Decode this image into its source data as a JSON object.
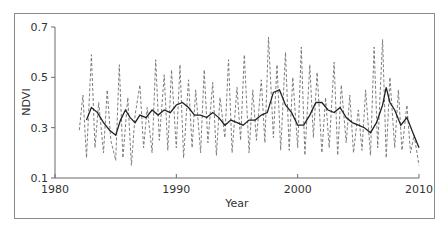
{
  "chart_data": {
    "type": "line",
    "title": "",
    "xlabel": "Year",
    "ylabel": "NDVI",
    "xlim": [
      1980,
      2010
    ],
    "ylim": [
      0.1,
      0.7
    ],
    "x_ticks": [
      1980,
      1990,
      2000,
      2010
    ],
    "y_ticks": [
      0.1,
      0.3,
      0.5,
      0.7
    ],
    "x_tick_labels": [
      "1980",
      "1990",
      "2000",
      "2010"
    ],
    "y_tick_labels": [
      "0.1",
      "0.3",
      "0.5",
      "0.7"
    ],
    "grid": false,
    "legend": null,
    "series": [
      {
        "name": "NDVI (raw)",
        "style": "dashed",
        "x": [
          1982.0,
          1982.3,
          1982.6,
          1983.0,
          1983.3,
          1983.6,
          1984.0,
          1984.3,
          1984.6,
          1985.0,
          1985.3,
          1985.6,
          1986.0,
          1986.3,
          1986.6,
          1987.0,
          1987.3,
          1987.6,
          1988.0,
          1988.3,
          1988.6,
          1989.0,
          1989.3,
          1989.6,
          1990.0,
          1990.3,
          1990.6,
          1991.0,
          1991.3,
          1991.6,
          1992.0,
          1992.3,
          1992.6,
          1993.0,
          1993.3,
          1993.6,
          1994.0,
          1994.3,
          1994.6,
          1995.0,
          1995.3,
          1995.6,
          1996.0,
          1996.3,
          1996.6,
          1997.0,
          1997.3,
          1997.6,
          1998.0,
          1998.3,
          1998.6,
          1999.0,
          1999.3,
          1999.6,
          2000.0,
          2000.3,
          2000.6,
          2001.0,
          2001.3,
          2001.6,
          2002.0,
          2002.3,
          2002.6,
          2003.0,
          2003.3,
          2003.6,
          2004.0,
          2004.3,
          2004.6,
          2005.0,
          2005.3,
          2005.6,
          2006.0,
          2006.3,
          2006.6,
          2007.0,
          2007.3,
          2007.6,
          2008.0,
          2008.3,
          2008.6,
          2009.0,
          2009.3,
          2009.6,
          2010.0
        ],
        "values": [
          0.29,
          0.43,
          0.18,
          0.59,
          0.22,
          0.4,
          0.2,
          0.45,
          0.25,
          0.17,
          0.55,
          0.18,
          0.42,
          0.15,
          0.35,
          0.47,
          0.22,
          0.38,
          0.2,
          0.57,
          0.25,
          0.51,
          0.21,
          0.53,
          0.22,
          0.55,
          0.18,
          0.49,
          0.22,
          0.45,
          0.2,
          0.53,
          0.24,
          0.48,
          0.19,
          0.42,
          0.26,
          0.57,
          0.2,
          0.46,
          0.25,
          0.59,
          0.2,
          0.45,
          0.25,
          0.49,
          0.24,
          0.66,
          0.26,
          0.55,
          0.21,
          0.6,
          0.21,
          0.5,
          0.22,
          0.62,
          0.19,
          0.55,
          0.26,
          0.52,
          0.2,
          0.42,
          0.22,
          0.56,
          0.19,
          0.47,
          0.24,
          0.43,
          0.2,
          0.37,
          0.21,
          0.45,
          0.19,
          0.62,
          0.22,
          0.65,
          0.18,
          0.5,
          0.22,
          0.45,
          0.21,
          0.39,
          0.2,
          0.27,
          0.15
        ],
        "note": "Values estimated from pixel positions; dashed series shows strong intra-annual oscillation"
      },
      {
        "name": "NDVI (smoothed)",
        "style": "solid",
        "x": [
          1982.6,
          1983.0,
          1983.5,
          1984.0,
          1984.5,
          1985.0,
          1985.4,
          1985.8,
          1986.2,
          1986.6,
          1987.0,
          1987.5,
          1988.0,
          1988.5,
          1989.0,
          1989.5,
          1990.0,
          1990.5,
          1991.0,
          1991.5,
          1992.0,
          1992.5,
          1993.0,
          1993.5,
          1994.0,
          1994.5,
          1995.0,
          1995.5,
          1996.0,
          1996.5,
          1997.0,
          1997.5,
          1998.0,
          1998.5,
          1999.0,
          1999.5,
          2000.0,
          2000.5,
          2001.0,
          2001.5,
          2002.0,
          2002.5,
          2003.0,
          2003.5,
          2004.0,
          2004.5,
          2005.0,
          2005.5,
          2006.0,
          2006.5,
          2007.0,
          2007.3,
          2007.6,
          2008.0,
          2008.5,
          2009.0,
          2009.5,
          2010.0
        ],
        "values": [
          0.33,
          0.38,
          0.36,
          0.32,
          0.29,
          0.27,
          0.33,
          0.37,
          0.34,
          0.32,
          0.35,
          0.34,
          0.37,
          0.35,
          0.37,
          0.36,
          0.39,
          0.4,
          0.38,
          0.35,
          0.35,
          0.34,
          0.36,
          0.34,
          0.31,
          0.33,
          0.32,
          0.31,
          0.33,
          0.33,
          0.35,
          0.36,
          0.44,
          0.45,
          0.39,
          0.36,
          0.31,
          0.31,
          0.35,
          0.4,
          0.4,
          0.37,
          0.36,
          0.38,
          0.34,
          0.32,
          0.31,
          0.3,
          0.28,
          0.32,
          0.39,
          0.46,
          0.4,
          0.37,
          0.31,
          0.34,
          0.28,
          0.22
        ]
      }
    ]
  }
}
